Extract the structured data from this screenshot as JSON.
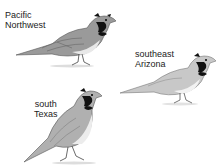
{
  "figure": {
    "birds": [
      {
        "label_line1": "Pacific",
        "label_line2": "Northwest"
      },
      {
        "label_line1": "southeast",
        "label_line2": "Arizona"
      },
      {
        "label_line1": "south",
        "label_line2": "Texas"
      }
    ]
  }
}
